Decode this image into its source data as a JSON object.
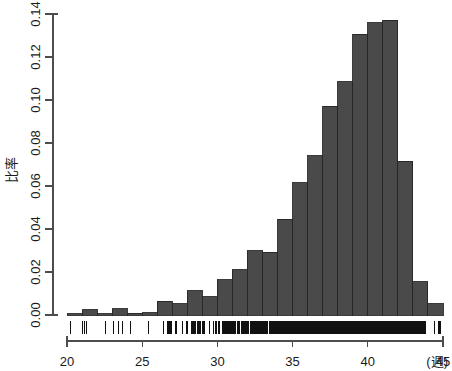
{
  "chart_data": {
    "type": "bar",
    "title": "",
    "subtitle": "",
    "xlabel": "(週)",
    "ylabel": "比率",
    "xlim": [
      20,
      45
    ],
    "ylim": [
      0.0,
      0.14
    ],
    "grid": false,
    "legend": null,
    "bin_width": 1,
    "x_ticks": [
      20,
      25,
      30,
      35,
      40,
      45
    ],
    "x_tick_labels": [
      "20",
      "25",
      "30",
      "35",
      "40",
      "45"
    ],
    "y_ticks": [
      0.0,
      0.02,
      0.04,
      0.06,
      0.08,
      0.1,
      0.12,
      0.14
    ],
    "y_tick_labels": [
      "0.00",
      "0.02",
      "0.04",
      "0.06",
      "0.08",
      "0.10",
      "0.12",
      "0.14"
    ],
    "bar_color": "#4a4a4a",
    "bar_edge_color": "#262626",
    "axis_color": "#4d4d4d",
    "categories": [
      "20-21",
      "21-22",
      "22-23",
      "23-24",
      "24-25",
      "25-26",
      "26-27",
      "27-28",
      "28-29",
      "29-30",
      "30-31",
      "31-32",
      "32-33",
      "33-34",
      "34-35",
      "35-36",
      "36-37",
      "37-38",
      "38-39",
      "39-40",
      "40-41",
      "41-42",
      "42-43",
      "43-44",
      "44-45"
    ],
    "bin_starts": [
      20,
      21,
      22,
      23,
      24,
      25,
      26,
      27,
      28,
      29,
      30,
      31,
      32,
      33,
      34,
      35,
      36,
      37,
      38,
      39,
      40,
      41,
      42,
      43,
      44
    ],
    "values": [
      0.0005,
      0.0025,
      0.0005,
      0.0028,
      0.0008,
      0.001,
      0.0065,
      0.0052,
      0.0112,
      0.0085,
      0.0165,
      0.021,
      0.03,
      0.0292,
      0.0445,
      0.0615,
      0.074,
      0.097,
      0.1085,
      0.1305,
      0.136,
      0.137,
      0.0715,
      0.0155,
      0.0052
    ],
    "rug": {
      "present": true,
      "description": "dense rug of individual observations along the x-axis baseline, saturating solid between roughly 33 and 43 weeks",
      "dense_range": [
        32.8,
        43.2
      ]
    }
  },
  "axes": {
    "y_axis_label": "比率",
    "x_axis_unit": "(週)"
  }
}
